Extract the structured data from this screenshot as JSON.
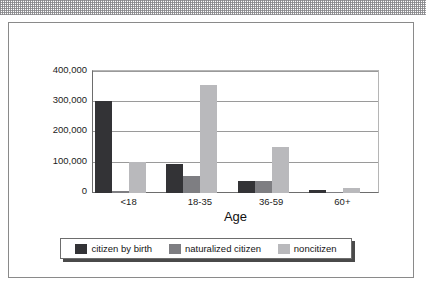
{
  "document": {
    "kind": "scanned-page",
    "top_band": "halftone-dither-strip"
  },
  "chart_data": {
    "type": "bar",
    "title": "",
    "subtitle": "",
    "xlabel": "Age",
    "ylabel": "",
    "categories": [
      "<18",
      "18-35",
      "36-59",
      "60+"
    ],
    "series": [
      {
        "name": "citizen by birth",
        "color": "#333336",
        "values": [
          300000,
          95000,
          40000,
          10000
        ]
      },
      {
        "name": "naturalized citizen",
        "color": "#7e7e82",
        "values": [
          5000,
          55000,
          38000,
          3000
        ]
      },
      {
        "name": "noncitizen",
        "color": "#b9b9bc",
        "values": [
          100000,
          355000,
          150000,
          15000
        ]
      }
    ],
    "ylim": [
      0,
      400000
    ],
    "yticks": [
      0,
      100000,
      200000,
      300000,
      400000
    ],
    "ytick_labels": [
      "0",
      "100,000",
      "200,000",
      "300,000",
      "400,000"
    ],
    "grid": true,
    "legend_position": "bottom",
    "bar_orientation": "vertical",
    "grouping": "clustered"
  },
  "axis": {
    "x_title": "Age",
    "x_tick_labels": [
      "<18",
      "18-35",
      "36-59",
      "60+"
    ],
    "y_tick_labels": [
      "400,000",
      "300,000",
      "200,000",
      "100,000",
      "0"
    ]
  },
  "legend": {
    "items": [
      {
        "label": "citizen by birth",
        "swatch": "#333336"
      },
      {
        "label": "naturalized citizen",
        "swatch": "#7e7e82"
      },
      {
        "label": "noncitizen",
        "swatch": "#b9b9bc"
      }
    ]
  },
  "colors": {
    "series_dark": "#333336",
    "series_mid": "#7e7e82",
    "series_light": "#b9b9bc",
    "frame": "#8a8a8a",
    "axis": "#6d6d6d",
    "gridline": "#9a9a9a",
    "page": "#ffffff"
  }
}
